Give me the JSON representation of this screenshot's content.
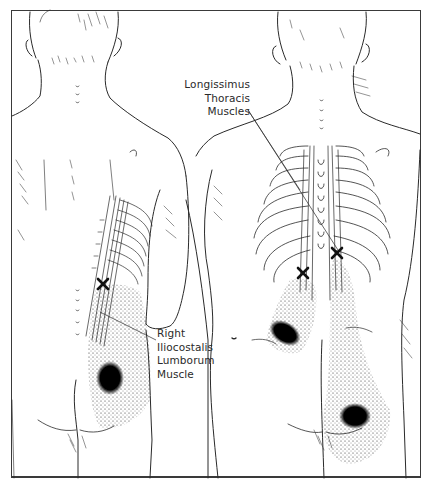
{
  "figure": {
    "type": "anatomical-illustration",
    "views": [
      "back-view-left-figure",
      "back-view-right-figure"
    ],
    "labels": {
      "longissimus": {
        "lines": [
          "Longissimus",
          "Thoracis",
          "Muscles"
        ]
      },
      "iliocostalis": {
        "lines": [
          "Right",
          "Iliocostalis",
          "Lumborum",
          "Muscle"
        ]
      }
    },
    "markers": {
      "trigger_point_symbol": "X",
      "referred_pain_style": "stippled-dots-with-dark-core"
    },
    "colors": {
      "line": "#2a2a2a",
      "pain_core": "#0d0d0d",
      "background": "#ffffff"
    }
  }
}
